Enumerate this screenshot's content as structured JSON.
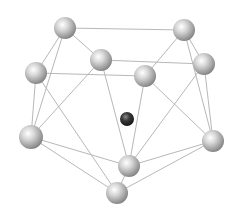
{
  "diagram": {
    "type": "cluster-structure",
    "background": "#ffffff",
    "edge_color": "#b8b8b8",
    "atom_color": "#c8c8c8",
    "center_atom_color": "#2a2a2a",
    "atoms": [
      {
        "id": "A",
        "x": 65,
        "y": 28,
        "r": 11
      },
      {
        "id": "B",
        "x": 184,
        "y": 30,
        "r": 11
      },
      {
        "id": "C",
        "x": 101,
        "y": 60,
        "r": 11
      },
      {
        "id": "D",
        "x": 36,
        "y": 73,
        "r": 11
      },
      {
        "id": "E",
        "x": 204,
        "y": 64,
        "r": 11
      },
      {
        "id": "F",
        "x": 145,
        "y": 76,
        "r": 11
      },
      {
        "id": "G",
        "x": 31,
        "y": 137,
        "r": 12
      },
      {
        "id": "H",
        "x": 213,
        "y": 141,
        "r": 11
      },
      {
        "id": "I",
        "x": 129,
        "y": 166,
        "r": 11
      },
      {
        "id": "J",
        "x": 117,
        "y": 193,
        "r": 11
      }
    ],
    "center_atom": {
      "id": "X",
      "x": 127,
      "y": 119,
      "r": 7
    },
    "edges": [
      [
        "A",
        "B"
      ],
      [
        "A",
        "C"
      ],
      [
        "A",
        "D"
      ],
      [
        "A",
        "G"
      ],
      [
        "B",
        "E"
      ],
      [
        "B",
        "F"
      ],
      [
        "B",
        "H"
      ],
      [
        "C",
        "E"
      ],
      [
        "C",
        "G"
      ],
      [
        "C",
        "I"
      ],
      [
        "D",
        "F"
      ],
      [
        "D",
        "G"
      ],
      [
        "D",
        "J"
      ],
      [
        "E",
        "H"
      ],
      [
        "E",
        "I"
      ],
      [
        "F",
        "I"
      ],
      [
        "F",
        "H"
      ],
      [
        "G",
        "I"
      ],
      [
        "G",
        "J"
      ],
      [
        "H",
        "I"
      ],
      [
        "H",
        "J"
      ],
      [
        "I",
        "J"
      ]
    ]
  }
}
